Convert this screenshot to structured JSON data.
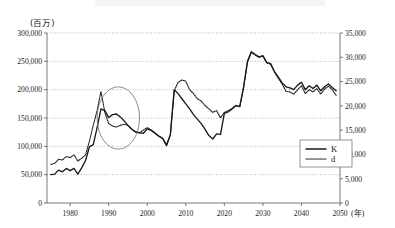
{
  "figure": {
    "unit_left": "(百万)",
    "unit_x": "(年)",
    "background": "#ffffff",
    "line_color": "#1a1a1a"
  },
  "legend": {
    "position": "bottom-right-inside",
    "entries": [
      {
        "label": "K",
        "style": "solid"
      },
      {
        "label": "d",
        "style": "dotted"
      }
    ]
  },
  "annotation": {
    "shape": "ellipse",
    "x_range": [
      1987,
      1998
    ],
    "y_range": [
      95000,
      205000
    ],
    "note": ""
  },
  "chart_data": {
    "type": "line",
    "title": "",
    "subtitle": "",
    "xlabel": "(年)",
    "ylabel": "(百万)",
    "y2label": "",
    "grid": true,
    "legend_position": "bottom-right",
    "xlim": [
      1974,
      2050
    ],
    "xticks": [
      1980,
      1990,
      2000,
      2010,
      2020,
      2030,
      2040,
      2050
    ],
    "xticklabels": [
      "1980",
      "1990",
      "2000",
      "2010",
      "2020",
      "2030",
      "2040",
      "2050"
    ],
    "ylim": [
      0,
      300000
    ],
    "yticks": [
      0,
      50000,
      100000,
      150000,
      200000,
      250000,
      300000
    ],
    "yticklabels": [
      "0",
      "50,000",
      "100,000",
      "150,000",
      "200,000",
      "250,000",
      "300,000"
    ],
    "y2lim": [
      0,
      35000
    ],
    "y2ticks": [
      0,
      5000,
      10000,
      15000,
      20000,
      25000,
      30000,
      35000
    ],
    "y2ticklabels": [
      "0",
      "5,000",
      "10,000",
      "15,000",
      "20,000",
      "25,000",
      "30,000",
      "35,000"
    ],
    "x": [
      1975,
      1976,
      1977,
      1978,
      1979,
      1980,
      1981,
      1982,
      1983,
      1984,
      1985,
      1986,
      1987,
      1988,
      1989,
      1990,
      1991,
      1992,
      1993,
      1994,
      1995,
      1996,
      1997,
      1998,
      1999,
      2000,
      2001,
      2002,
      2003,
      2004,
      2005,
      2006,
      2007,
      2008,
      2009,
      2010,
      2011,
      2012,
      2013,
      2014,
      2015,
      2016,
      2017,
      2018,
      2019,
      2020,
      2021,
      2022,
      2023,
      2024,
      2025,
      2026,
      2027,
      2028,
      2029,
      2030,
      2031,
      2032,
      2033,
      2034,
      2035,
      2036,
      2037,
      2038,
      2039,
      2040,
      2041,
      2042,
      2043,
      2044,
      2045,
      2046,
      2047,
      2048,
      2049
    ],
    "series": [
      {
        "name": "K",
        "axis": "left",
        "style": "solid",
        "values": [
          50000,
          51000,
          58000,
          55000,
          61000,
          57000,
          61000,
          51000,
          62000,
          75000,
          99000,
          103000,
          133000,
          166000,
          163000,
          151000,
          156000,
          157000,
          152000,
          145000,
          137000,
          130000,
          125000,
          124000,
          123000,
          131000,
          128000,
          123000,
          118000,
          114000,
          102000,
          121000,
          200000,
          193000,
          184000,
          175000,
          166000,
          156000,
          148000,
          140000,
          130000,
          119000,
          113000,
          122000,
          121000,
          158000,
          161000,
          166000,
          172000,
          170000,
          205000,
          250000,
          267000,
          262000,
          258000,
          260000,
          248000,
          246000,
          232000,
          222000,
          212000,
          205000,
          203000,
          200000,
          208000,
          213000,
          200000,
          207000,
          202000,
          208000,
          198000,
          205000,
          210000,
          204000,
          198000
        ]
      },
      {
        "name": "d",
        "axis": "left",
        "style": "dotted",
        "values": [
          68000,
          70000,
          77000,
          76000,
          82000,
          80000,
          85000,
          74000,
          79000,
          85000,
          109000,
          137000,
          163000,
          197000,
          160000,
          140000,
          136000,
          134000,
          137000,
          139000,
          137000,
          130000,
          126000,
          124000,
          129000,
          133000,
          129000,
          124000,
          118000,
          114000,
          101000,
          120000,
          198000,
          213000,
          217000,
          215000,
          200000,
          193000,
          184000,
          180000,
          172000,
          166000,
          160000,
          163000,
          150000,
          160000,
          163000,
          167000,
          172000,
          170000,
          204000,
          248000,
          266000,
          261000,
          257000,
          259000,
          247000,
          245000,
          231000,
          220000,
          210000,
          197000,
          196000,
          192000,
          200000,
          207000,
          193000,
          200000,
          196000,
          202000,
          192000,
          201000,
          206000,
          200000,
          190000
        ]
      }
    ]
  }
}
